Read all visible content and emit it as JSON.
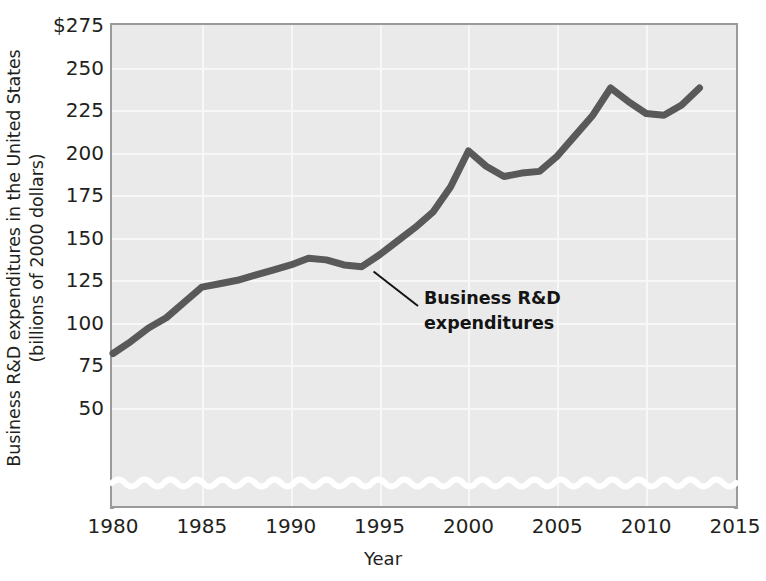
{
  "chart_data": {
    "type": "line",
    "title": "",
    "subtitle": "",
    "xlabel": "Year",
    "ylabel": "Business R&D expenditures in the United States",
    "ylabel_line2": "(billions of 2000 dollars)",
    "xlim": [
      1980,
      2015
    ],
    "ylim": [
      25,
      275
    ],
    "y_axis_break": true,
    "grid": true,
    "legend_position": "none",
    "series_color": "#595959",
    "plot_background": "#eaeaea",
    "gridline_color": "#f7f7f7",
    "xticks": [
      "1980",
      "1985",
      "1990",
      "1995",
      "2000",
      "2005",
      "2010",
      "2015"
    ],
    "xtick_values": [
      1980,
      1985,
      1990,
      1995,
      2000,
      2005,
      2010,
      2015
    ],
    "yticks": [
      "$275",
      "250",
      "225",
      "200",
      "175",
      "150",
      "125",
      "100",
      "75",
      "50"
    ],
    "ytick_values": [
      275,
      250,
      225,
      200,
      175,
      150,
      125,
      100,
      75,
      50
    ],
    "annotations": [
      {
        "text_line1": "Business R&D",
        "text_line2": "expenditures",
        "points_to_x": 1995,
        "points_to_y": 136
      }
    ],
    "series": [
      {
        "name": "Business R&D expenditures",
        "color": "#595959",
        "x": [
          1980,
          1981,
          1982,
          1983,
          1984,
          1985,
          1986,
          1987,
          1988,
          1989,
          1990,
          1991,
          1992,
          1993,
          1994,
          1995,
          1996,
          1997,
          1998,
          1999,
          2000,
          2001,
          2002,
          2003,
          2004,
          2005,
          2006,
          2007,
          2008,
          2009,
          2010,
          2011,
          2012,
          2013
        ],
        "values": [
          82,
          89,
          97,
          103,
          112,
          121,
          123,
          125,
          128,
          131,
          134,
          138,
          137,
          134,
          133,
          140,
          148,
          156,
          165,
          180,
          201,
          192,
          186,
          188,
          189,
          198,
          210,
          222,
          238,
          230,
          223,
          222,
          228,
          238
        ]
      }
    ]
  },
  "xaxis": {
    "label": "Year",
    "ticks": [
      {
        "label": "1980",
        "value": 1980
      },
      {
        "label": "1985",
        "value": 1985
      },
      {
        "label": "1990",
        "value": 1990
      },
      {
        "label": "1995",
        "value": 1995
      },
      {
        "label": "2000",
        "value": 2000
      },
      {
        "label": "2005",
        "value": 2005
      },
      {
        "label": "2010",
        "value": 2010
      },
      {
        "label": "2015",
        "value": 2015
      }
    ]
  },
  "yaxis": {
    "label_line1": "Business R&D expenditures in the United States",
    "label_line2": "(billions of 2000 dollars)",
    "ticks": [
      {
        "label": "$275",
        "value": 275
      },
      {
        "label": "250",
        "value": 250
      },
      {
        "label": "225",
        "value": 225
      },
      {
        "label": "200",
        "value": 200
      },
      {
        "label": "175",
        "value": 175
      },
      {
        "label": "150",
        "value": 150
      },
      {
        "label": "125",
        "value": 125
      },
      {
        "label": "100",
        "value": 100
      },
      {
        "label": "75",
        "value": 75
      },
      {
        "label": "50",
        "value": 50
      }
    ]
  },
  "annotation": {
    "line1": "Business R&D",
    "line2": "expenditures"
  }
}
